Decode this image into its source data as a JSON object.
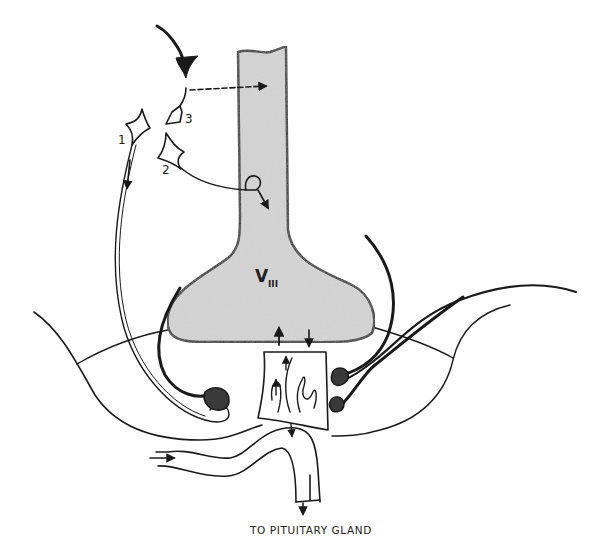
{
  "figure": {
    "type": "anatomical-diagram",
    "labels": {
      "neuron_1": "1",
      "neuron_2": "2",
      "neuron_3": "3",
      "ventricle_letter": "V",
      "ventricle_subscript": "III",
      "caption": "TO PITUITARY GLAND"
    },
    "colors": {
      "ink": "#1a1a1a",
      "ventricle_fill": "#d6d6d6",
      "dark_cell_fill": "#3a3a3a",
      "background": "#ffffff"
    }
  }
}
